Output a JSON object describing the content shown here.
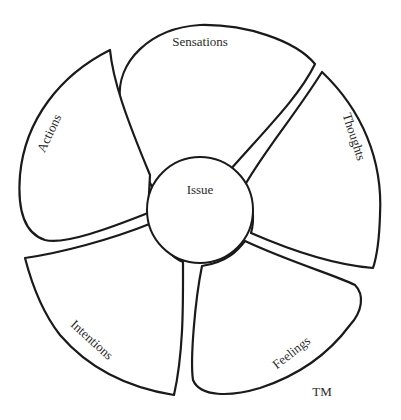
{
  "diagram": {
    "center": {
      "label": "Issue"
    },
    "petals": [
      {
        "id": "sensations",
        "label": "Sensations"
      },
      {
        "id": "thoughts",
        "label": "Thoughts"
      },
      {
        "id": "feelings",
        "label": "Feelings"
      },
      {
        "id": "intentions",
        "label": "Intentions"
      },
      {
        "id": "actions",
        "label": "Actions"
      }
    ],
    "trademark": "TM",
    "colors": {
      "stroke": "#1a1a1a",
      "fill": "#ffffff",
      "text": "#2a2a2a"
    }
  }
}
